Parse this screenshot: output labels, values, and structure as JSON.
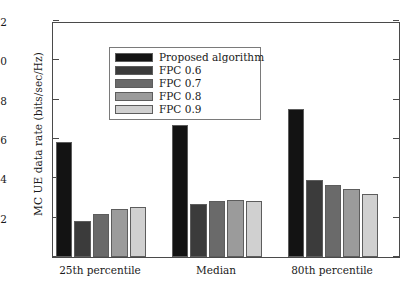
{
  "chart_data": {
    "type": "bar",
    "title": "",
    "xlabel": "",
    "ylabel": "MC UE data rate (bits/sec/Hz)",
    "categories": [
      "25th percentile",
      "Median",
      "80th percentile"
    ],
    "series": [
      {
        "name": "Proposed algorithm",
        "color": "#131313",
        "values": [
          5.85,
          6.7,
          7.55
        ]
      },
      {
        "name": "FPC 0.6",
        "color": "#3b3b3b",
        "values": [
          1.83,
          2.7,
          3.92
        ]
      },
      {
        "name": "FPC 0.7",
        "color": "#6a6a6a",
        "values": [
          2.19,
          2.83,
          3.66
        ]
      },
      {
        "name": "FPC 0.8",
        "color": "#9b9b9b",
        "values": [
          2.42,
          2.88,
          3.45
        ]
      },
      {
        "name": "FPC 0.9",
        "color": "#d0d0d0",
        "values": [
          2.54,
          2.86,
          3.18
        ]
      }
    ],
    "ylim": [
      0,
      12
    ],
    "yticks": [
      0,
      2,
      4,
      6,
      8,
      10,
      12
    ],
    "ytick_labels": [
      "",
      "2",
      "4",
      "6",
      "8",
      "10",
      "12"
    ],
    "grid": false,
    "legend_position": "upper left",
    "legend_entries": [
      "Proposed algorithm",
      "FPC 0.6",
      "FPC 0.7",
      "FPC 0.8",
      "FPC 0.9"
    ],
    "axis_color": "#4a4a4a",
    "bar_edge_color": "#5d5d5d"
  }
}
